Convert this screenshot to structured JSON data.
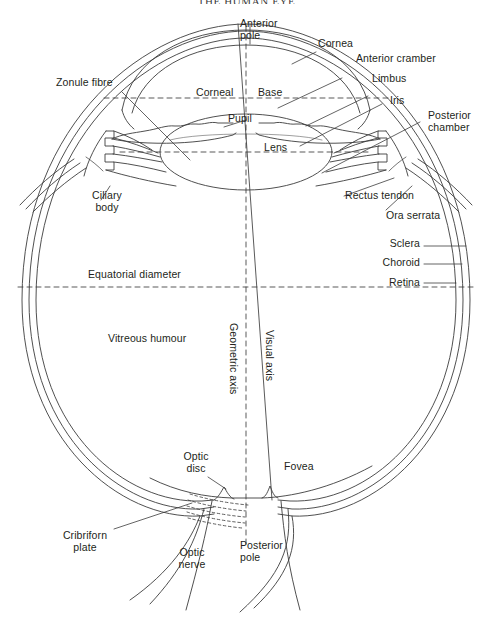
{
  "figure": {
    "title": "THE HUMAN EYE",
    "background_color": "#ffffff",
    "line_color": "#3c3c3c",
    "text_color": "#231f20"
  },
  "labels": {
    "anterior_pole": "Anterior\npole",
    "cornea": "Cornea",
    "anterior_chamber": "Anterior cramber",
    "limbus": "Limbus",
    "iris": "Iris",
    "posterior_chamber": "Posterior\nchamber",
    "zonule_fibre": "Zonule fibre",
    "corneal": "Corneal",
    "base": "Base",
    "pupil": "Pupil",
    "lens": "Lens",
    "ciliary_body": "Ciliary\nbody",
    "rectus_tendon": "Rectus tendon",
    "ora_serrata": "Ora serrata",
    "sclera": "Sclera",
    "choroid": "Choroid",
    "retina": "Retina",
    "equatorial_diameter": "Equatorial diameter",
    "vitreous_humour": "Vitreous humour",
    "geometric_axis": "Geometric axis",
    "visual_axis": "Visual axis",
    "optic_disc": "Optic\ndisc",
    "fovea": "Fovea",
    "cribriform_plate": "Cribriforn\nplate",
    "optic_nerve": "Optic\nnerve",
    "posterior_pole": "Posterior\npole"
  }
}
